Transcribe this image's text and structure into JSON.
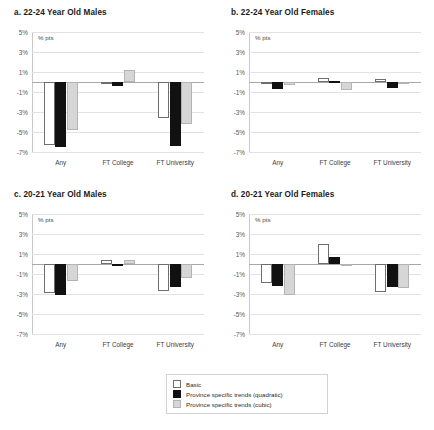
{
  "figure": {
    "units_label": "% pts",
    "categories": [
      "Any",
      "FT College",
      "FT University"
    ],
    "yticks": [
      "5%",
      "3%",
      "1%",
      "-1%",
      "-3%",
      "-5%",
      "-7%"
    ],
    "ylim": [
      -7,
      5
    ],
    "series_names": [
      "Basic",
      "Province specific trends (quadratic)",
      "Province specific trends (cubic)"
    ],
    "colors": {
      "basic": "#ffffff",
      "quadratic": "#111111",
      "cubic": "#d6d6d6",
      "outline": "#6e6e6e",
      "gridline": "#e2e2e2",
      "zeroline": "#a8a8a8"
    }
  },
  "legend": {
    "items": [
      {
        "label": "Basic",
        "key": "basic"
      },
      {
        "label": "Province specific trends (quadratic)",
        "key": "quad"
      },
      {
        "label": "Province specific trends (cubic)",
        "key": "cubic"
      }
    ]
  },
  "panels": [
    {
      "id": "a",
      "title": "a. 22-24 Year Old Males",
      "chart_data": {
        "type": "bar",
        "title": "a. 22-24 Year Old Males",
        "xlabel": "",
        "ylabel": "% pts",
        "ylim": [
          -7,
          5
        ],
        "yticks": [
          5,
          3,
          1,
          -1,
          -3,
          -5,
          -7
        ],
        "grid": true,
        "legend_position": "bottom-center-shared",
        "categories": [
          "Any",
          "FT College",
          "FT University"
        ],
        "series": [
          {
            "name": "Basic",
            "values": [
              -6.3,
              -0.2,
              -3.6
            ]
          },
          {
            "name": "Province specific trends (quadratic)",
            "values": [
              -6.5,
              -0.4,
              -6.4
            ]
          },
          {
            "name": "Province specific trends (cubic)",
            "values": [
              -4.8,
              1.2,
              -4.2
            ]
          }
        ]
      }
    },
    {
      "id": "b",
      "title": "b. 22-24 Year Old Females",
      "chart_data": {
        "type": "bar",
        "title": "b. 22-24 Year Old Females",
        "xlabel": "",
        "ylabel": "% pts",
        "ylim": [
          -7,
          5
        ],
        "yticks": [
          5,
          3,
          1,
          -1,
          -3,
          -5,
          -7
        ],
        "grid": true,
        "legend_position": "bottom-center-shared",
        "categories": [
          "Any",
          "FT College",
          "FT University"
        ],
        "series": [
          {
            "name": "Basic",
            "values": [
              -0.05,
              0.45,
              0.35
            ]
          },
          {
            "name": "Province specific trends (quadratic)",
            "values": [
              -0.7,
              0.1,
              -0.6
            ]
          },
          {
            "name": "Province specific trends (cubic)",
            "values": [
              -0.25,
              -0.8,
              -0.2
            ]
          }
        ]
      }
    },
    {
      "id": "c",
      "title": "c. 20-21 Year Old Males",
      "chart_data": {
        "type": "bar",
        "title": "c. 20-21 Year Old Males",
        "xlabel": "",
        "ylabel": "% pts",
        "ylim": [
          -7,
          5
        ],
        "yticks": [
          5,
          3,
          1,
          -1,
          -3,
          -5,
          -7
        ],
        "grid": true,
        "legend_position": "bottom-center-shared",
        "categories": [
          "Any",
          "FT College",
          "FT University"
        ],
        "series": [
          {
            "name": "Basic",
            "values": [
              -2.9,
              0.4,
              -2.7
            ]
          },
          {
            "name": "Province specific trends (quadratic)",
            "values": [
              -3.1,
              -0.2,
              -2.3
            ]
          },
          {
            "name": "Province specific trends (cubic)",
            "values": [
              -1.7,
              0.4,
              -1.4
            ]
          }
        ]
      }
    },
    {
      "id": "d",
      "title": "d. 20-21 Year Old Females",
      "chart_data": {
        "type": "bar",
        "title": "d. 20-21 Year Old Females",
        "xlabel": "",
        "ylabel": "% pts",
        "ylim": [
          -7,
          5
        ],
        "yticks": [
          5,
          3,
          1,
          -1,
          -3,
          -5,
          -7
        ],
        "grid": true,
        "legend_position": "bottom-center-shared",
        "categories": [
          "Any",
          "FT College",
          "FT University"
        ],
        "series": [
          {
            "name": "Basic",
            "values": [
              -1.9,
              2.0,
              -2.8
            ]
          },
          {
            "name": "Province specific trends (quadratic)",
            "values": [
              -2.2,
              0.7,
              -2.3
            ]
          },
          {
            "name": "Province specific trends (cubic)",
            "values": [
              -3.1,
              0.0,
              -2.4
            ]
          }
        ]
      }
    }
  ]
}
